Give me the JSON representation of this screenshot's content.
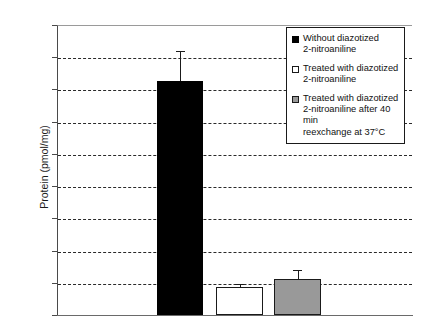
{
  "chart_data": {
    "type": "bar",
    "title": "",
    "subtitle": "",
    "xlabel": "",
    "ylabel": "Protein (pmol/mg)",
    "ylim": [
      0,
      4500
    ],
    "ytick_values": [
      0,
      500,
      1000,
      1500,
      2000,
      2500,
      3000,
      3500,
      4000,
      4500
    ],
    "ytick_labels": [
      "0",
      "500",
      "1000",
      "1500",
      "2000",
      "2500",
      "3000",
      "3500",
      "4000",
      "4500"
    ],
    "grid": true,
    "grid_style": "dashed-horizontal",
    "xtick_labels": [
      "",
      "",
      ""
    ],
    "legend_position": "top-right",
    "categories": [
      "Without diazotized 2-nitroaniline",
      "Treated with diazotized 2-nitroaniline",
      "Treated with diazotized 2-nitroaniline after 40 min reexchange at 37°C"
    ],
    "values": [
      3625,
      430,
      560
    ],
    "errors_upper": [
      450,
      40,
      130
    ],
    "bar_colors": [
      "#000000",
      "#ffffff",
      "#999999"
    ],
    "bars": [
      {
        "name": "without-diazotized",
        "value": 3625,
        "error_top": 4075,
        "fill": "#000000",
        "fill_class": "fill-black"
      },
      {
        "name": "treated-with-diazotized",
        "value": 430,
        "error_top": 470,
        "fill": "#ffffff",
        "fill_class": "fill-white"
      },
      {
        "name": "treated-after-reexchange",
        "value": 560,
        "error_top": 690,
        "fill": "#999999",
        "fill_class": "fill-gray"
      }
    ]
  },
  "legend": {
    "entries": [
      {
        "swatch": "black-square-swatch",
        "swatch_class": "sw-black",
        "label": "Without diazotized\n2-nitroaniline"
      },
      {
        "swatch": "white-square-swatch",
        "swatch_class": "sw-white",
        "label": "Treated with diazotized\n2-nitroaniline"
      },
      {
        "swatch": "gray-square-swatch",
        "swatch_class": "sw-gray",
        "label": "Treated with diazotized\n2-nitroaniline after 40 min\nreexchange at 37°C"
      }
    ]
  },
  "axis": {
    "y_title": "Protein (pmol/mg)"
  },
  "geometry": {
    "plot_left": 57,
    "plot_top": 25,
    "plot_width": 355,
    "plot_height": 290,
    "y_max": 4500,
    "bar_positions": [
      {
        "left": 99,
        "width": 46
      },
      {
        "left": 158,
        "width": 47
      },
      {
        "left": 216,
        "width": 47
      }
    ]
  }
}
